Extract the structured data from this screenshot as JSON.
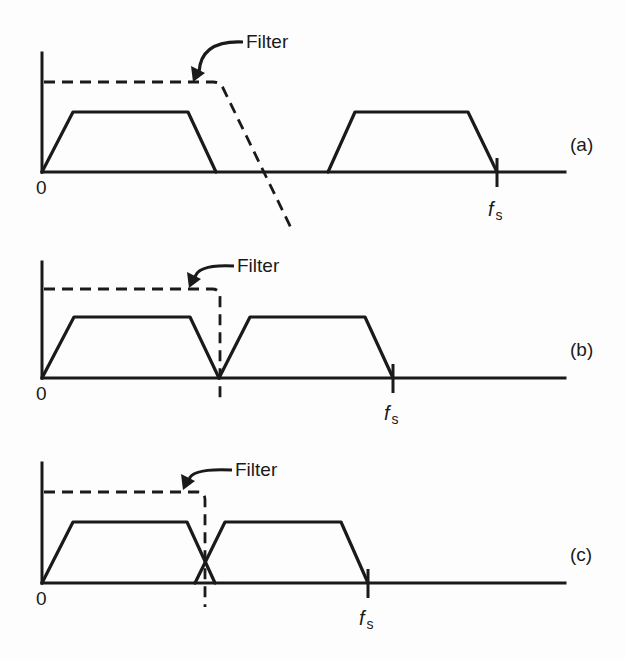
{
  "figure": {
    "filter_label": "Filter",
    "origin_label": "0",
    "fs_label_main": "f",
    "fs_label_sub": "s",
    "panels": [
      {
        "id": "a",
        "label": "(a)",
        "caption": "Sampling rate well above Nyquist; spectra widely separated; gradual filter roll-off",
        "baseline_y": 172,
        "axis_top_y": 53,
        "trap_top_y": 112,
        "filter_y": 82,
        "baseband": [
          42,
          73,
          188,
          216
        ],
        "image": [
          328,
          355,
          468,
          497
        ],
        "fs_x": 497,
        "filter_path": "M 44 82 L 213 82 Q 220 82 223 88 L 293 232",
        "arrow_tip": [
          193,
          82
        ],
        "filter_text_pos": [
          246,
          48
        ],
        "panel_label_pos": [
          570,
          151
        ],
        "fs_text_pos": [
          488,
          216
        ]
      },
      {
        "id": "b",
        "label": "(b)",
        "caption": "Sampling at exactly Nyquist; spectra just touch; brick-wall filter required",
        "baseline_y": 378,
        "axis_top_y": 262,
        "trap_top_y": 317,
        "filter_y": 289,
        "baseband": [
          42,
          74,
          190,
          219
        ],
        "image": [
          219,
          250,
          365,
          393
        ],
        "fs_x": 393,
        "filter_path": "M 44 289 L 212 289 Q 220 289 220 297 L 220 398",
        "arrow_tip": [
          189,
          288
        ],
        "filter_text_pos": [
          237,
          272
        ],
        "panel_label_pos": [
          570,
          356
        ],
        "fs_text_pos": [
          384,
          420
        ]
      },
      {
        "id": "c",
        "label": "(c)",
        "caption": "Undersampling; spectra overlap producing aliasing",
        "baseline_y": 583,
        "axis_top_y": 463,
        "trap_top_y": 522,
        "filter_y": 492,
        "baseband": [
          42,
          73,
          187,
          215
        ],
        "image": [
          195,
          225,
          341,
          368
        ],
        "fs_x": 368,
        "filter_path": "M 44 492 L 198 492 Q 205 492 205 500 L 205 607",
        "arrow_tip": [
          183,
          490
        ],
        "filter_text_pos": [
          235,
          476
        ],
        "panel_label_pos": [
          570,
          561
        ],
        "fs_text_pos": [
          359,
          625
        ]
      }
    ],
    "axis_end_x": 565,
    "colors": {
      "ink": "#1a1a1a",
      "paper": "#fdfdfd"
    }
  }
}
